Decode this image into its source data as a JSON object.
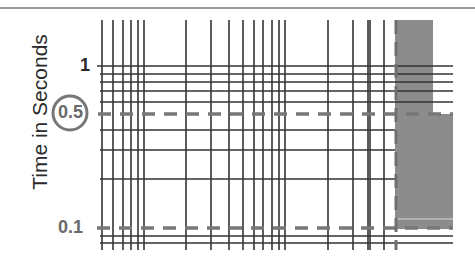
{
  "chart_data": {
    "type": "heatmap",
    "title": "",
    "xlabel": "",
    "ylabel": "Time in Seconds",
    "yscale": "log",
    "ylim": [
      0.08,
      2
    ],
    "y_ticks": [
      {
        "label": "1",
        "value": 1,
        "color": "#2a2a2a"
      },
      {
        "label": "0.5",
        "value": 0.5,
        "color": "#6a6a6a",
        "circled": true
      },
      {
        "label": "0.1",
        "value": 0.1,
        "color": "#6a6a6a"
      }
    ],
    "reference_lines": [
      {
        "orientation": "horizontal",
        "value": 0.5,
        "style": "dashed",
        "color": "#777777"
      },
      {
        "orientation": "horizontal",
        "value": 0.1,
        "style": "dashed",
        "color": "#777777"
      },
      {
        "orientation": "vertical",
        "style": "dashed",
        "color": "#777777",
        "x_px": 396
      }
    ],
    "grid": true,
    "highlight_region": {
      "color": "#8c8c8c",
      "description": "shaded block at right edge; narrow above 0.5, wider below 0.5"
    },
    "vertical_lines_px": [
      102,
      113,
      123,
      131,
      138,
      144,
      186,
      211,
      229,
      243,
      254,
      263,
      272,
      279,
      285,
      328,
      353,
      368,
      370,
      384
    ],
    "horizontal_lines_px": [
      66,
      74,
      82,
      91,
      102,
      130,
      150,
      179,
      236,
      243
    ],
    "colors": {
      "grid": "#333333",
      "dash": "#777777",
      "region": "#8c8c8c",
      "circle": "#777777"
    }
  }
}
